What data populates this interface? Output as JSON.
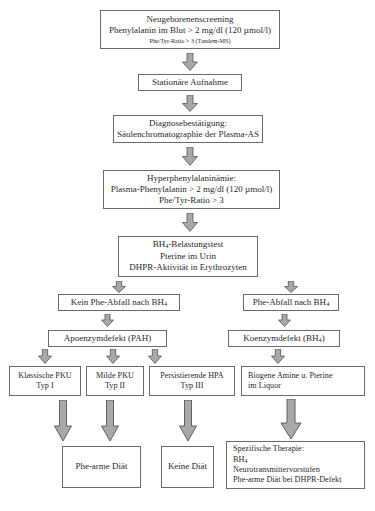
{
  "diagram": {
    "colors": {
      "arrow_fill": "#a8a8a8",
      "arrow_stroke": "#555555",
      "box_border": "#6b6b6b",
      "background": "#ffffff",
      "text": "#2a2a2a"
    },
    "nodes": {
      "screening": {
        "line1": "Neugeborenenscreening",
        "line2": "Phenylalanin im Blut > 2 mg/dl (120 µmol/l)",
        "line3": "Phe/Tyr-Ratio > 3  (Tandem-MS)"
      },
      "admission": {
        "line1": "Stationäre Aufnahme"
      },
      "confirmation": {
        "line1": "Diagnosebestätigung:",
        "line2": "Säulenchromatographie der Plasma-AS"
      },
      "hpa": {
        "line1": "Hyperphenylalaninämie:",
        "line2": "Plasma-Phenylalanin > 2 mg/dl (120 µmol/l)",
        "line3": "Phe/Tyr-Ratio > 3"
      },
      "bh4_test": {
        "line1_pre": "BH",
        "line1_sub": "4",
        "line1_post": "-Belastungstest",
        "line2": "Pterine im Urin",
        "line3": "DHPR-Aktivität in Erythrozyten"
      },
      "no_phe_drop": {
        "pre": "Kein Phe-Abfall nach BH",
        "sub": "4"
      },
      "phe_drop": {
        "pre": "Phe-Abfall nach BH",
        "sub": "4"
      },
      "apoenzyme": {
        "line1": "Apoenzymdefekt (PAH)"
      },
      "coenzyme": {
        "pre": "Koenzymdefekt (BH",
        "sub": "4",
        "post": ")"
      },
      "pku_classic": {
        "line1": "Klassische PKU",
        "line2": "Typ I"
      },
      "pku_mild": {
        "line1": "Milde PKU",
        "line2": "Typ II"
      },
      "hpa_persistent": {
        "line1": "Persistierende HPA",
        "line2": "Typ III"
      },
      "biogenic_amines": {
        "line1": "Biogene Amine u. Pterine",
        "line2": "im Liquor"
      },
      "diet_low_phe": {
        "line1": "Phe-arme Diät"
      },
      "diet_none": {
        "line1": "Keine Diät"
      },
      "specific_therapy": {
        "line1": "Spezifische Therapie:",
        "line2_pre": "BH",
        "line2_sub": "4",
        "line3": "Neurotransmittervorstufen",
        "line4": "Phe-arme Diät bei DHPR-Defekt"
      }
    }
  }
}
